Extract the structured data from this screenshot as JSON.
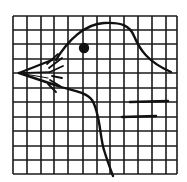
{
  "figure": {
    "width": 187,
    "height": 182,
    "background": "#ffffff",
    "ink_color": "#111111"
  },
  "grid": {
    "x_lines": [
      13,
      27,
      41,
      54,
      68,
      83,
      97,
      110,
      124,
      138,
      152,
      166,
      177
    ],
    "y_lines": [
      16,
      30,
      44,
      59,
      73,
      88,
      102,
      117,
      131,
      146,
      160,
      174
    ],
    "stroke_width": 1.6,
    "color": "#1a1a1a"
  },
  "drawing": {
    "head_outline": "M 56 60 C 68 40, 85 24, 104 23 C 122 22, 130 26, 134 36 C 140 50, 148 62, 171 72",
    "throat_outline": "M 52 84 C 66 90, 84 90, 92 100 C 100 112, 100 138, 104 150 C 107 160, 110 168, 113 176",
    "beak_upper": "M 19 73 L 52 60",
    "beak_lower": "M 19 73 L 52 84",
    "beak_mid": "M 19 73 L 50 72",
    "beak_mid2": "M 19 73 L 48 78",
    "feathers": [
      "M 47 64 L 58 54",
      "M 49 68 L 62 58",
      "M 50 72 L 63 66",
      "M 52 76 L 62 78",
      "M 50 80 L 60 86",
      "M 48 84 L 56 92"
    ],
    "eye": {
      "cx": 84,
      "cy": 48,
      "r": 5.2
    },
    "strokes_on_grid": [
      "M 130 102 L 168 101",
      "M 122 117 L 156 116"
    ],
    "outline_width": 2.4
  }
}
